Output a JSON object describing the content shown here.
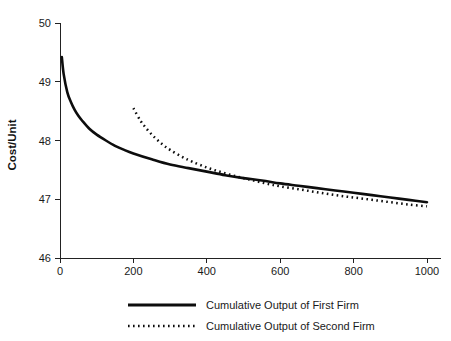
{
  "chart_data": {
    "type": "line",
    "title": "",
    "subtitle": "",
    "xlabel": "",
    "ylabel": "Cost/Unit",
    "xlim": [
      0,
      1040
    ],
    "ylim": [
      46,
      50
    ],
    "xticks": [
      0,
      200,
      400,
      600,
      800,
      1000
    ],
    "xticklabels": [
      "0",
      "200",
      "400",
      "600",
      "800",
      "1000"
    ],
    "yticks": [
      46,
      47,
      48,
      49,
      50
    ],
    "yticklabels": [
      "46",
      "47",
      "48",
      "49",
      "50"
    ],
    "grid": false,
    "legend_position": "below-axes",
    "series": [
      {
        "name": "Cumulative Output of First Firm",
        "style": "solid",
        "color": "#0d0d0d",
        "x": [
          5,
          10,
          20,
          30,
          40,
          50,
          60,
          80,
          100,
          125,
          150,
          175,
          200,
          250,
          300,
          350,
          400,
          450,
          500,
          550,
          600,
          650,
          700,
          750,
          800,
          850,
          900,
          950,
          1000
        ],
        "y": [
          49.42,
          49.13,
          48.82,
          48.65,
          48.52,
          48.42,
          48.34,
          48.2,
          48.1,
          48.0,
          47.91,
          47.84,
          47.78,
          47.68,
          47.59,
          47.53,
          47.47,
          47.41,
          47.36,
          47.32,
          47.27,
          47.23,
          47.19,
          47.15,
          47.11,
          47.07,
          47.03,
          46.99,
          46.95
        ]
      },
      {
        "name": "Cumulative Output of Second Firm",
        "style": "dotted",
        "color": "#0d0d0d",
        "x": [
          200,
          220,
          240,
          260,
          280,
          300,
          330,
          360,
          400,
          440,
          480,
          520,
          560,
          600,
          650,
          700,
          750,
          800,
          850,
          900,
          950,
          1000
        ],
        "y": [
          48.55,
          48.33,
          48.17,
          48.04,
          47.93,
          47.84,
          47.73,
          47.64,
          47.54,
          47.46,
          47.39,
          47.33,
          47.27,
          47.22,
          47.17,
          47.12,
          47.07,
          47.03,
          46.99,
          46.95,
          46.91,
          46.88
        ]
      }
    ]
  },
  "axes": {
    "y_title": "Cost/Unit"
  },
  "legend": {
    "entries": [
      {
        "label": "Cumulative Output of First Firm",
        "style": "solid"
      },
      {
        "label": "Cumulative Output of Second Firm",
        "style": "dotted"
      }
    ]
  }
}
